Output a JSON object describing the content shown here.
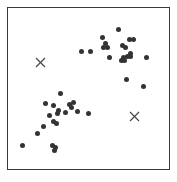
{
  "figure": {
    "name": "scatter-plot-two-clusters-with-x-markers",
    "background_color": "#ffffff",
    "frame_color": "#3a3a3a",
    "caption": ""
  },
  "chart_data": {
    "type": "scatter",
    "title": "",
    "subtitle": "",
    "xlabel": "",
    "ylabel": "",
    "xlim": [
      0,
      100
    ],
    "ylim": [
      0,
      100
    ],
    "grid": false,
    "legend": "none",
    "axis_ticks": {
      "x": [],
      "y": []
    },
    "point_style": {
      "marker": "circle",
      "color": "#333333",
      "size_px": 5
    },
    "marker_style": {
      "marker": "x",
      "color": "#4a4a4a",
      "size_px": 13
    },
    "series": [
      {
        "name": "data-points",
        "marker": "circle",
        "color": "#333333",
        "points": [
          [
            58.9,
            81.6
          ],
          [
            68.7,
            86.5
          ],
          [
            60.7,
            77.9
          ],
          [
            75.5,
            80.4
          ],
          [
            77.9,
            80.4
          ],
          [
            71.2,
            76.7
          ],
          [
            73.0,
            75.5
          ],
          [
            59.5,
            75.5
          ],
          [
            62.0,
            75.5
          ],
          [
            45.4,
            73.0
          ],
          [
            51.5,
            73.0
          ],
          [
            76.1,
            71.8
          ],
          [
            63.2,
            69.3
          ],
          [
            71.8,
            69.3
          ],
          [
            74.2,
            69.9
          ],
          [
            76.1,
            69.9
          ],
          [
            70.6,
            67.5
          ],
          [
            72.4,
            67.5
          ],
          [
            85.9,
            69.3
          ],
          [
            73.6,
            55.8
          ],
          [
            84.0,
            51.5
          ],
          [
            32.5,
            46.6
          ],
          [
            23.3,
            40.5
          ],
          [
            28.2,
            39.3
          ],
          [
            38.0,
            39.9
          ],
          [
            39.2,
            38.0
          ],
          [
            40.5,
            41.1
          ],
          [
            31.3,
            36.2
          ],
          [
            30.7,
            34.4
          ],
          [
            35.6,
            35.0
          ],
          [
            42.9,
            35.6
          ],
          [
            25.8,
            33.1
          ],
          [
            50.3,
            34.4
          ],
          [
            28.2,
            29.4
          ],
          [
            30.1,
            28.2
          ],
          [
            22.1,
            26.4
          ],
          [
            18.4,
            22.1
          ],
          [
            9.2,
            14.7
          ],
          [
            27.6,
            14.7
          ],
          [
            29.4,
            13.5
          ],
          [
            28.8,
            11.7
          ]
        ]
      },
      {
        "name": "x-markers",
        "marker": "x",
        "color": "#4a4a4a",
        "points": [
          [
            20.2,
            66.3
          ],
          [
            78.5,
            32.5
          ]
        ]
      }
    ]
  }
}
